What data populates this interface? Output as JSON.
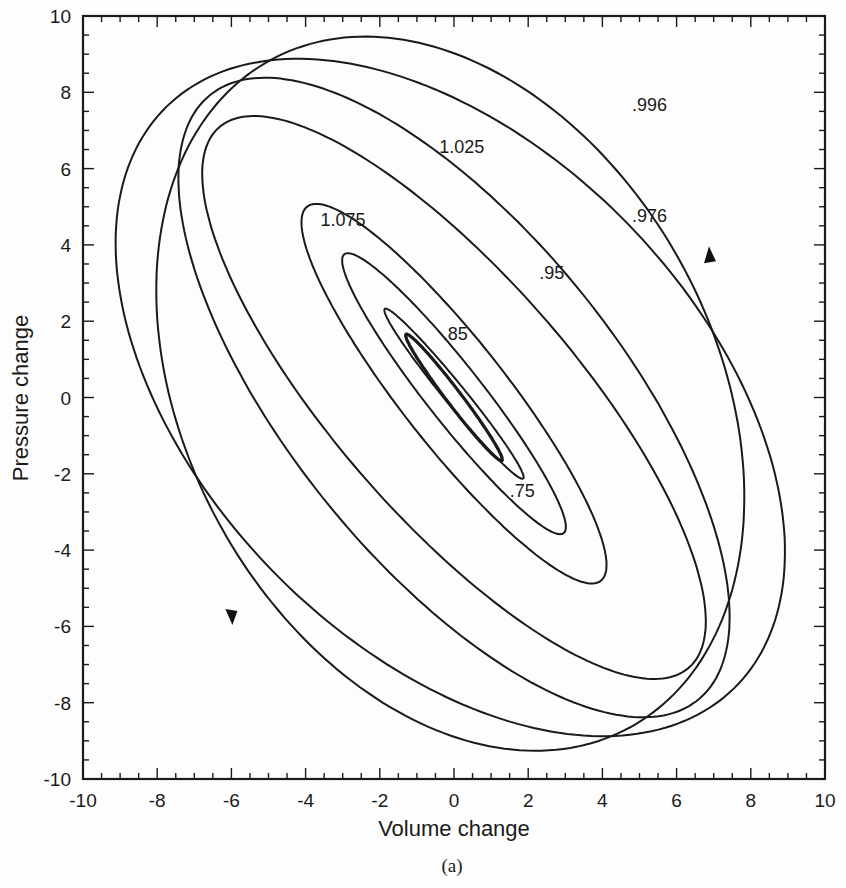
{
  "chart_data": {
    "type": "line",
    "title": "",
    "caption": "(a)",
    "xlabel": "Volume change",
    "ylabel": "Pressure change",
    "xlim": [
      -10,
      10
    ],
    "ylim": [
      -10,
      10
    ],
    "grid": false,
    "x_ticks": [
      "-10",
      "-8",
      "-6",
      "-4",
      "-2",
      "0",
      "2",
      "4",
      "6",
      "8",
      "10"
    ],
    "y_ticks": [
      "-10",
      "-8",
      "-6",
      "-4",
      "-2",
      "0",
      "2",
      "4",
      "6",
      "8",
      "10"
    ],
    "series": [
      {
        "name": "innermost",
        "label": "",
        "center": [
          0,
          0
        ],
        "semi_major": 2.1,
        "semi_minor": 0.2,
        "angle_deg": -52,
        "stroke": 3.2
      },
      {
        "name": ".75",
        "label": ".75",
        "center": [
          0,
          0.1
        ],
        "semi_major": 2.9,
        "semi_minor": 0.28,
        "angle_deg": -50,
        "stroke": 2
      },
      {
        "name": ".85",
        "label": ".85",
        "center": [
          0,
          0.1
        ],
        "semi_major": 4.7,
        "semi_minor": 0.75,
        "angle_deg": -51,
        "stroke": 2
      },
      {
        "name": "1.075",
        "label": "1.075",
        "center": [
          0,
          0.1
        ],
        "semi_major": 6.3,
        "semi_minor": 1.4,
        "angle_deg": -51,
        "stroke": 2
      },
      {
        "name": ".95",
        "label": ".95",
        "center": [
          0,
          0
        ],
        "semi_major": 9.5,
        "semi_minor": 3.2,
        "angle_deg": -48,
        "stroke": 2
      },
      {
        "name": "1.025",
        "label": "1.025",
        "center": [
          0,
          0
        ],
        "semi_major": 10.3,
        "semi_minor": 4.4,
        "angle_deg": -50,
        "stroke": 2
      },
      {
        "name": ".976",
        "label": ".976",
        "center": [
          -0.1,
          0
        ],
        "semi_major": 10.8,
        "semi_minor": 6.6,
        "angle_deg": -44,
        "stroke": 2
      },
      {
        "name": ".996",
        "label": ".996",
        "center": [
          -0.1,
          0.1
        ],
        "semi_major": 10.0,
        "semi_minor": 7.1,
        "angle_deg": -60,
        "stroke": 2
      }
    ],
    "annotations": [
      {
        "text": ".996",
        "x": 4.8,
        "y": 7.5
      },
      {
        "text": "1.025",
        "x": -0.4,
        "y": 6.4
      },
      {
        "text": ".976",
        "x": 4.8,
        "y": 4.6
      },
      {
        "text": "1.075",
        "x": -3.6,
        "y": 4.5
      },
      {
        "text": ".95",
        "x": 2.3,
        "y": 3.1
      },
      {
        "text": ".85",
        "x": -0.3,
        "y": 1.5
      },
      {
        "text": ".75",
        "x": 1.5,
        "y": -2.6
      }
    ],
    "arrows": [
      {
        "on": ".996",
        "x": 6.9,
        "y": 3.7,
        "direction": "up"
      },
      {
        "on": ".996",
        "x": -6.0,
        "y": -5.7,
        "direction": "down"
      }
    ]
  }
}
